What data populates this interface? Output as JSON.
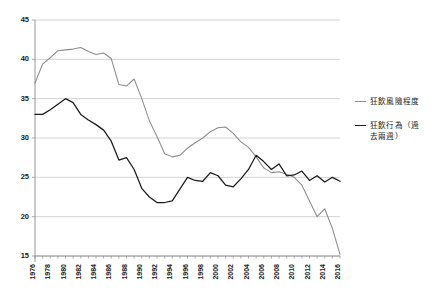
{
  "chart_data": {
    "type": "line",
    "title": "",
    "subtitle": "",
    "xlabel": "",
    "ylabel": "",
    "xlim": [
      1976,
      2016
    ],
    "ylim": [
      15,
      45
    ],
    "y_ticks": [
      15,
      20,
      25,
      30,
      35,
      40,
      45
    ],
    "x_ticks": [
      1976,
      1978,
      1980,
      1982,
      1984,
      1986,
      1988,
      1990,
      1992,
      1994,
      1996,
      1998,
      2000,
      2002,
      2004,
      2006,
      2008,
      2010,
      2012,
      2014,
      2016
    ],
    "grid": true,
    "legend_position": "right",
    "x": [
      1976,
      1977,
      1978,
      1979,
      1980,
      1981,
      1982,
      1983,
      1984,
      1985,
      1986,
      1987,
      1988,
      1989,
      1990,
      1991,
      1992,
      1993,
      1994,
      1995,
      1996,
      1997,
      1998,
      1999,
      2000,
      2001,
      2002,
      2003,
      2004,
      2005,
      2006,
      2007,
      2008,
      2009,
      2010,
      2011,
      2012,
      2013,
      2014,
      2015,
      2016
    ],
    "series": [
      {
        "name": "狂飲風險程度",
        "color": "#8c8c8c",
        "values": [
          37.0,
          39.4,
          40.2,
          41.1,
          41.2,
          41.3,
          41.5,
          41.0,
          40.6,
          40.8,
          40.1,
          36.8,
          36.6,
          37.5,
          35.0,
          32.2,
          30.2,
          28.0,
          27.6,
          27.8,
          28.7,
          29.4,
          30.0,
          30.8,
          31.3,
          31.4,
          30.6,
          29.5,
          28.8,
          27.6,
          26.2,
          25.6,
          25.7,
          25.4,
          25.0,
          24.0,
          22.0,
          20.0,
          21.0,
          18.5,
          15.2
        ]
      },
      {
        "name": "狂飲行為（過去兩週）",
        "color": "#1a1a1a",
        "values": [
          33.0,
          33.0,
          33.6,
          34.3,
          35.0,
          34.5,
          33.0,
          32.3,
          31.7,
          31.0,
          29.6,
          27.2,
          27.5,
          26.0,
          23.6,
          22.5,
          21.8,
          21.8,
          22.0,
          23.5,
          25.0,
          24.6,
          24.5,
          25.6,
          25.2,
          24.0,
          23.8,
          24.8,
          26.0,
          27.8,
          27.0,
          26.0,
          26.7,
          25.2,
          25.3,
          25.8,
          24.6,
          25.2,
          24.4,
          25.0,
          24.5
        ]
      }
    ]
  },
  "legend": {
    "items": [
      {
        "label": "狂飲風險程度",
        "color": "#8c8c8c"
      },
      {
        "label": "狂飲行為（過\n去兩週）",
        "color": "#1a1a1a"
      }
    ]
  }
}
